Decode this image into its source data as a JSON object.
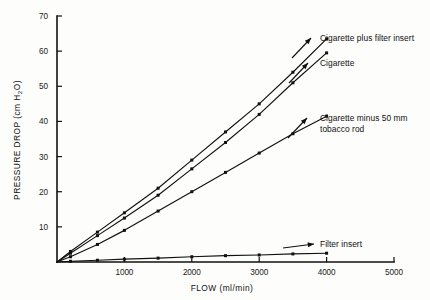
{
  "chart_data": {
    "type": "line",
    "title": "",
    "xlabel": "FLOW   (ml/min)",
    "ylabel": "PRESSURE DROP   (cm H2O)",
    "ylabel_main": "PRESSURE DROP",
    "ylabel_unit_open": "(cm H",
    "ylabel_unit_sub": "2",
    "ylabel_unit_close": "O)",
    "xlim": [
      0,
      5000
    ],
    "ylim": [
      0,
      70
    ],
    "xticks": [
      0,
      1000,
      2000,
      3000,
      4000,
      5000
    ],
    "xtick_labels": [
      "",
      "1000",
      "2000",
      "3000",
      "4000",
      "5000"
    ],
    "yticks": [
      0,
      10,
      20,
      30,
      40,
      50,
      60,
      70
    ],
    "ytick_labels": [
      "",
      "10",
      "20",
      "30",
      "40",
      "50",
      "60",
      "70"
    ],
    "grid": false,
    "legend_position": "inline-annotations",
    "line_color": "#111111",
    "series": [
      {
        "name": "Cigarette plus filter insert",
        "label": "Cigarette plus filter insert",
        "x": [
          0,
          200,
          600,
          1000,
          1500,
          2000,
          2500,
          3000,
          3500,
          4000
        ],
        "values": [
          0,
          3,
          8.5,
          14,
          21,
          29,
          37,
          45,
          54,
          63.5
        ]
      },
      {
        "name": "Cigarette",
        "label": "Cigarette",
        "x": [
          0,
          200,
          600,
          1000,
          1500,
          2000,
          2500,
          3000,
          3500,
          4000
        ],
        "values": [
          0,
          2.5,
          7.5,
          12.5,
          19,
          26.5,
          34,
          42,
          51,
          59.5
        ]
      },
      {
        "name": "Cigarette minus 50 mm tobacco rod",
        "label_line1": "Cigarette minus 50 mm",
        "label_line2": "tobacco rod",
        "label": "Cigarette minus 50 mm tobacco rod",
        "x": [
          0,
          200,
          600,
          1000,
          1500,
          2000,
          2500,
          3000,
          3500,
          4000
        ],
        "values": [
          0,
          1.5,
          5,
          9,
          14.5,
          20,
          25.5,
          31,
          36.5,
          41.5
        ]
      },
      {
        "name": "Filter insert",
        "label": "Filter insert",
        "x": [
          0,
          200,
          600,
          1000,
          1500,
          2000,
          2500,
          3000,
          3500,
          4000
        ],
        "values": [
          0,
          0.2,
          0.5,
          0.8,
          1.1,
          1.5,
          1.8,
          2.0,
          2.3,
          2.5
        ]
      }
    ]
  }
}
